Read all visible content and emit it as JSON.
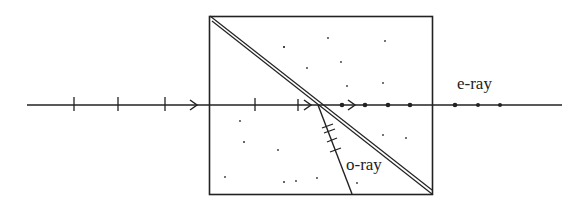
{
  "diagram": {
    "labels": {
      "e_ray": "e-ray",
      "o_ray": "o-ray"
    },
    "colors": {
      "line": "#222222",
      "background": "#ffffff"
    }
  }
}
